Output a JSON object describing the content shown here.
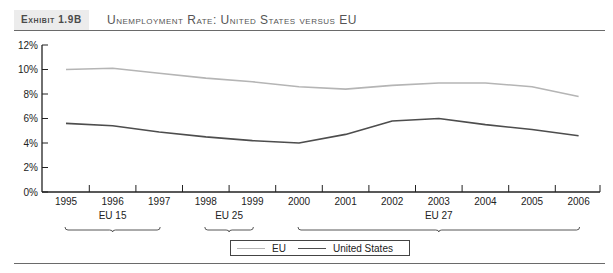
{
  "header": {
    "exhibit_label": "Exhibit 1.9B",
    "title": "Unemployment Rate: United States versus EU"
  },
  "legend": {
    "items": [
      {
        "label": "EU",
        "color": "#b5b5b5"
      },
      {
        "label": "United States",
        "color": "#4d4d4d"
      }
    ]
  },
  "groups": [
    {
      "label": "EU 15",
      "from": "1995",
      "to": "1997"
    },
    {
      "label": "EU 25",
      "from": "1998",
      "to": "1999"
    },
    {
      "label": "EU 27",
      "from": "2000",
      "to": "2006"
    }
  ],
  "chart_data": {
    "type": "line",
    "title": "Unemployment Rate: United States versus EU",
    "xlabel": "",
    "ylabel": "",
    "x": [
      "1995",
      "1996",
      "1997",
      "1998",
      "1999",
      "2000",
      "2001",
      "2002",
      "2003",
      "2004",
      "2005",
      "2006"
    ],
    "yticks": [
      "0%",
      "2%",
      "4%",
      "6%",
      "8%",
      "10%",
      "12%"
    ],
    "ylim": [
      0,
      12
    ],
    "grid": false,
    "legend_position": "bottom-center",
    "series": [
      {
        "name": "EU",
        "color": "#b5b5b5",
        "values": [
          10.0,
          10.1,
          9.7,
          9.3,
          9.0,
          8.6,
          8.4,
          8.7,
          8.9,
          8.9,
          8.6,
          7.8
        ]
      },
      {
        "name": "United States",
        "color": "#4d4d4d",
        "values": [
          5.6,
          5.4,
          4.9,
          4.5,
          4.2,
          4.0,
          4.7,
          5.8,
          6.0,
          5.5,
          5.1,
          4.6
        ]
      }
    ],
    "annotations": [
      {
        "text": "EU 15",
        "span": [
          "1995",
          "1997"
        ]
      },
      {
        "text": "EU 25",
        "span": [
          "1998",
          "1999"
        ]
      },
      {
        "text": "EU 27",
        "span": [
          "2000",
          "2006"
        ]
      }
    ]
  }
}
